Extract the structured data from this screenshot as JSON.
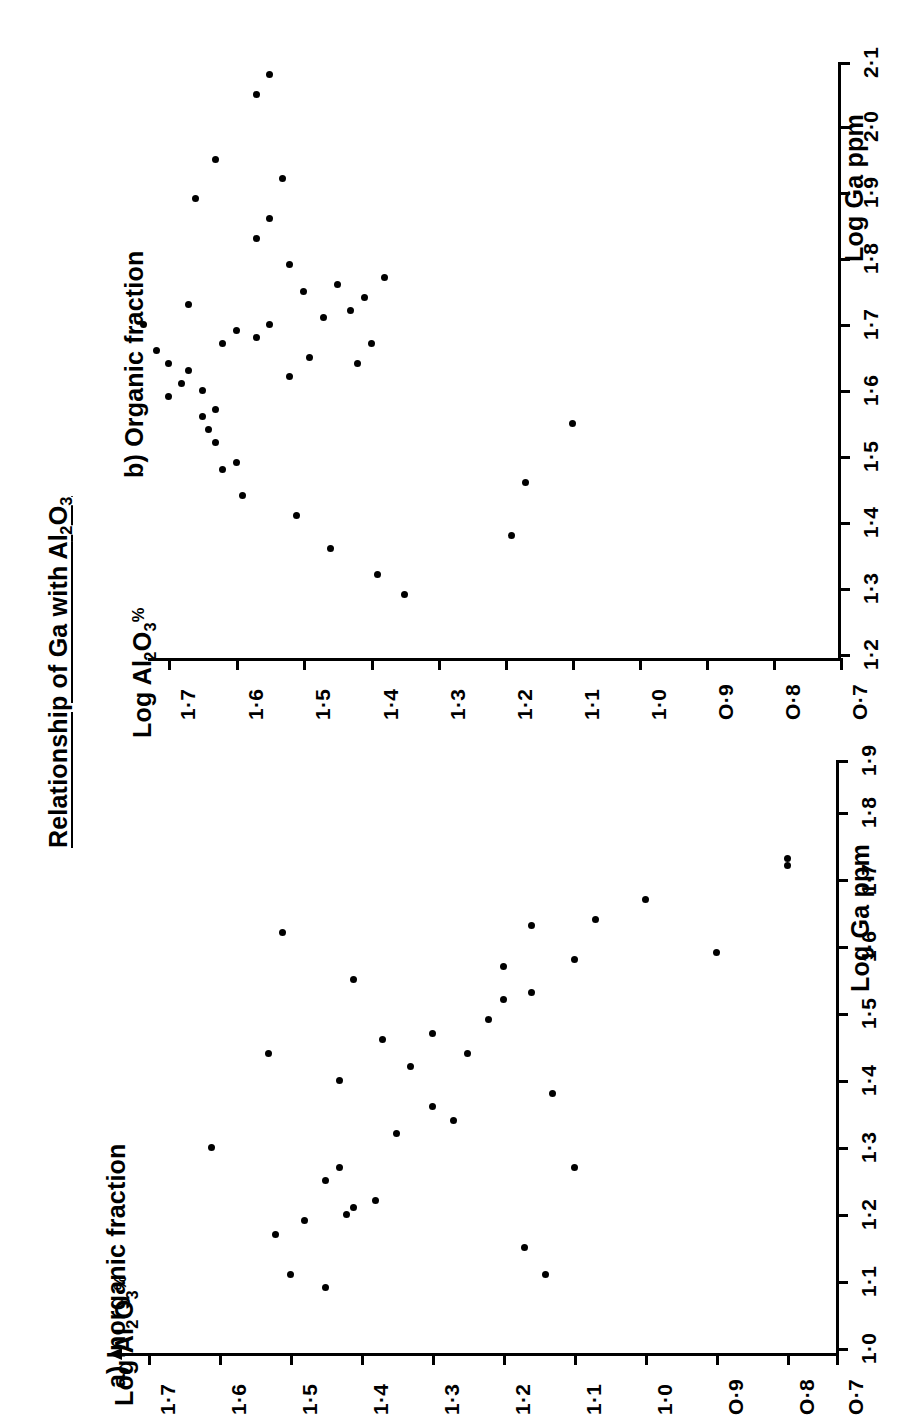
{
  "figure": {
    "main_title": "Relationship of Ga with Al2O3",
    "main_title_display": "Relationship of Ga with Al",
    "background_color": "#ffffff",
    "ink_color": "#000000",
    "orientation": "rotated-90-ccw",
    "y_axis_label": "Log Al2O3%",
    "x_axis_label": "Log Ga ppm"
  },
  "panels": [
    {
      "id": "a",
      "title": "a) Inorganic fraction",
      "y_label": "Log Al2O3%",
      "x_label": "Log Ga ppm",
      "y_ticks": [
        "1·7",
        "1·6",
        "1·5",
        "1·4",
        "1·3",
        "1·2",
        "1·1",
        "1·0",
        "O·9",
        "O·8",
        "O·7"
      ],
      "x_ticks": [
        "1·0",
        "1·1",
        "1·2",
        "1·3",
        "1·4",
        "1·5",
        "1·6",
        "1·7",
        "1·8",
        "1·9"
      ],
      "has_y_arrow": true
    },
    {
      "id": "b",
      "title": "b) Organic fraction",
      "y_label": "Log Al2O3%",
      "x_label": "Log Ga ppm",
      "y_ticks": [
        "1·7",
        "1·6",
        "1·5",
        "1·4",
        "1·3",
        "1·2",
        "1·1",
        "1·0",
        "O·9",
        "O·8",
        "O·7"
      ],
      "x_ticks": [
        "1·2",
        "1·3",
        "1·4",
        "1·5",
        "1·6",
        "1·7",
        "1·8",
        "1·9",
        "2·0",
        "2·1"
      ],
      "has_y_arrow": false
    }
  ],
  "chart_data": [
    {
      "type": "scatter",
      "id": "a",
      "title": "a) Inorganic fraction",
      "xlabel": "Log Ga ppm",
      "ylabel": "Log Al2O3%",
      "xlim": [
        1.0,
        1.9
      ],
      "ylim": [
        0.7,
        1.75
      ],
      "grid": false,
      "legend": "none",
      "points": [
        {
          "x": 1.09,
          "y": 1.45
        },
        {
          "x": 1.11,
          "y": 1.5
        },
        {
          "x": 1.11,
          "y": 1.14
        },
        {
          "x": 1.15,
          "y": 1.17
        },
        {
          "x": 1.17,
          "y": 1.52
        },
        {
          "x": 1.19,
          "y": 1.48
        },
        {
          "x": 1.2,
          "y": 1.42
        },
        {
          "x": 1.21,
          "y": 1.41
        },
        {
          "x": 1.22,
          "y": 1.38
        },
        {
          "x": 1.25,
          "y": 1.45
        },
        {
          "x": 1.27,
          "y": 1.43
        },
        {
          "x": 1.27,
          "y": 1.1
        },
        {
          "x": 1.3,
          "y": 1.61
        },
        {
          "x": 1.32,
          "y": 1.35
        },
        {
          "x": 1.34,
          "y": 1.27
        },
        {
          "x": 1.36,
          "y": 1.3
        },
        {
          "x": 1.38,
          "y": 1.13
        },
        {
          "x": 1.4,
          "y": 1.43
        },
        {
          "x": 1.42,
          "y": 1.33
        },
        {
          "x": 1.44,
          "y": 1.25
        },
        {
          "x": 1.44,
          "y": 1.53
        },
        {
          "x": 1.46,
          "y": 1.37
        },
        {
          "x": 1.47,
          "y": 1.3
        },
        {
          "x": 1.49,
          "y": 1.22
        },
        {
          "x": 1.52,
          "y": 1.2
        },
        {
          "x": 1.53,
          "y": 1.16
        },
        {
          "x": 1.55,
          "y": 1.41
        },
        {
          "x": 1.57,
          "y": 1.2
        },
        {
          "x": 1.58,
          "y": 1.1
        },
        {
          "x": 1.62,
          "y": 1.51
        },
        {
          "x": 1.63,
          "y": 1.16
        },
        {
          "x": 1.64,
          "y": 1.07
        },
        {
          "x": 1.67,
          "y": 1.0
        },
        {
          "x": 1.72,
          "y": 0.8
        },
        {
          "x": 1.73,
          "y": 0.8
        },
        {
          "x": 1.59,
          "y": 0.9
        }
      ]
    },
    {
      "type": "scatter",
      "id": "b",
      "title": "b) Organic fraction",
      "xlabel": "Log Ga ppm",
      "ylabel": "Log Al2O3%",
      "xlim": [
        1.2,
        2.15
      ],
      "ylim": [
        0.7,
        1.75
      ],
      "grid": false,
      "legend": "none",
      "points": [
        {
          "x": 1.29,
          "y": 1.35
        },
        {
          "x": 1.32,
          "y": 1.39
        },
        {
          "x": 1.36,
          "y": 1.46
        },
        {
          "x": 1.38,
          "y": 1.19
        },
        {
          "x": 1.41,
          "y": 1.51
        },
        {
          "x": 1.44,
          "y": 1.59
        },
        {
          "x": 1.46,
          "y": 1.17
        },
        {
          "x": 1.48,
          "y": 1.62
        },
        {
          "x": 1.49,
          "y": 1.6
        },
        {
          "x": 1.52,
          "y": 1.63
        },
        {
          "x": 1.54,
          "y": 1.64
        },
        {
          "x": 1.55,
          "y": 1.1
        },
        {
          "x": 1.56,
          "y": 1.65
        },
        {
          "x": 1.57,
          "y": 1.63
        },
        {
          "x": 1.59,
          "y": 1.7
        },
        {
          "x": 1.6,
          "y": 1.65
        },
        {
          "x": 1.61,
          "y": 1.68
        },
        {
          "x": 1.62,
          "y": 1.52
        },
        {
          "x": 1.63,
          "y": 1.67
        },
        {
          "x": 1.64,
          "y": 1.42
        },
        {
          "x": 1.64,
          "y": 1.7
        },
        {
          "x": 1.65,
          "y": 1.49
        },
        {
          "x": 1.66,
          "y": 1.72
        },
        {
          "x": 1.67,
          "y": 1.4
        },
        {
          "x": 1.67,
          "y": 1.62
        },
        {
          "x": 1.68,
          "y": 1.57
        },
        {
          "x": 1.69,
          "y": 1.6
        },
        {
          "x": 1.7,
          "y": 1.55
        },
        {
          "x": 1.7,
          "y": 1.74
        },
        {
          "x": 1.71,
          "y": 1.47
        },
        {
          "x": 1.72,
          "y": 1.43
        },
        {
          "x": 1.73,
          "y": 1.67
        },
        {
          "x": 1.74,
          "y": 1.41
        },
        {
          "x": 1.75,
          "y": 1.5
        },
        {
          "x": 1.76,
          "y": 1.45
        },
        {
          "x": 1.77,
          "y": 1.38
        },
        {
          "x": 1.79,
          "y": 1.52
        },
        {
          "x": 1.83,
          "y": 1.57
        },
        {
          "x": 1.86,
          "y": 1.55
        },
        {
          "x": 1.89,
          "y": 1.66
        },
        {
          "x": 1.92,
          "y": 1.53
        },
        {
          "x": 1.95,
          "y": 1.63
        },
        {
          "x": 2.05,
          "y": 1.57
        },
        {
          "x": 2.08,
          "y": 1.55
        }
      ]
    }
  ]
}
